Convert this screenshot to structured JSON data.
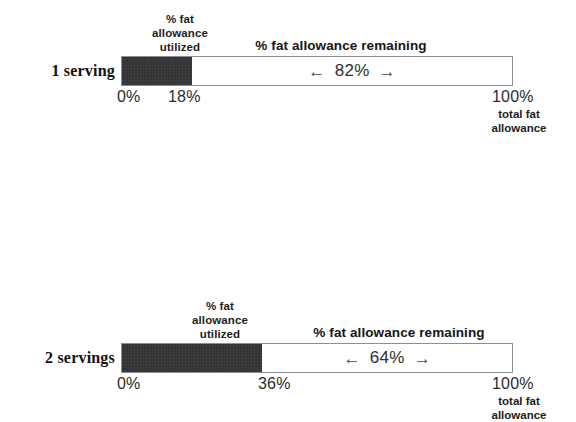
{
  "chart_data": {
    "type": "bar",
    "title": "",
    "subtitle": "",
    "xlabel": "",
    "ylabel": "",
    "xlim": [
      0,
      100
    ],
    "grid": false,
    "legend": "none",
    "orientation": "horizontal",
    "stacked": true,
    "categories": [
      "1 serving",
      "2 servings"
    ],
    "series": [
      {
        "name": "% fat allowance utilized",
        "values": [
          18,
          36
        ]
      },
      {
        "name": "% fat allowance remaining",
        "values": [
          82,
          64
        ]
      }
    ],
    "annotations": [
      "1 serving: 18% utilized, 82% remaining of total fat allowance",
      "2 servings: 36% utilized, 64% remaining of total fat allowance"
    ],
    "colors": {
      "utilized": "#333335",
      "remaining": "#ffffff",
      "outline": "#8e8e8e",
      "text": "#1a1a1a",
      "background": "#ffffff"
    }
  },
  "rows": [
    {
      "series_label": "1 serving",
      "header_utilized": "% fat\nallowance\nutilized",
      "header_utilized_lines": [
        "% fat",
        "allowance",
        "utilized"
      ],
      "header_remaining": "% fat allowance remaining",
      "remaining_value": "82%",
      "arrow_left": "←",
      "arrow_right": "→",
      "tick_start": "0%",
      "tick_mid": "18%",
      "tick_end": "100%",
      "total_caption_lines": [
        "total fat",
        "allowance"
      ],
      "utilized_pct": 18,
      "remaining_pct": 82
    },
    {
      "series_label": "2 servings",
      "header_utilized": "% fat\nallowance\nutilized",
      "header_utilized_lines": [
        "% fat",
        "allowance",
        "utilized"
      ],
      "header_remaining": "% fat allowance remaining",
      "remaining_value": "64%",
      "arrow_left": "←",
      "arrow_right": "→",
      "tick_start": "0%",
      "tick_mid": "36%",
      "tick_end": "100%",
      "total_caption_lines": [
        "total fat",
        "allowance"
      ],
      "utilized_pct": 36,
      "remaining_pct": 64
    }
  ]
}
